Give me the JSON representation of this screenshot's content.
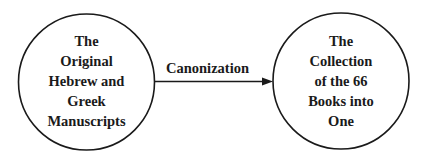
{
  "diagram": {
    "type": "flow",
    "colors": {
      "stroke": "#1a1a1a",
      "text": "#1a1a1a",
      "background": "#ffffff"
    },
    "nodes": [
      {
        "id": "source",
        "shape": "circle",
        "lines": [
          "The",
          "Original",
          "Hebrew and",
          "Greek",
          "Manuscripts"
        ]
      },
      {
        "id": "target",
        "shape": "circle",
        "lines": [
          "The",
          "Collection",
          "of the 66",
          "Books into",
          "One"
        ]
      }
    ],
    "edges": [
      {
        "from": "source",
        "to": "target",
        "label": "Canonization",
        "arrow": "right"
      }
    ]
  }
}
